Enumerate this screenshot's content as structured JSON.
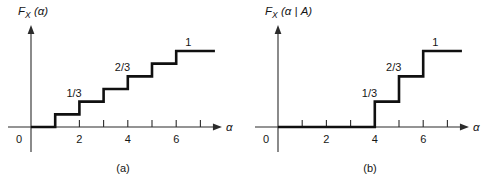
{
  "figure": {
    "background_color": "#ffffff",
    "line_color": "#101010",
    "axis_color": "#2b2b2b"
  },
  "chart_data": [
    {
      "type": "line",
      "panel_id": "a",
      "caption": "(a)",
      "title": "F_X(α)",
      "title_parts": {
        "F": "F",
        "sub": "X",
        "arg": "(α)"
      },
      "xlabel": "α",
      "ylabel": "",
      "xlim": [
        -1,
        8
      ],
      "ylim": [
        0,
        1.18
      ],
      "grid": false,
      "legend": "none",
      "x_ticks": [
        1,
        2,
        3,
        4,
        5,
        6,
        7
      ],
      "x_tick_labels": [
        "",
        "2",
        "",
        "4",
        "",
        "6",
        ""
      ],
      "origin_label": "0",
      "step_x": [
        1,
        2,
        3,
        4,
        5,
        6
      ],
      "step_y": [
        0.1667,
        0.3333,
        0.5,
        0.6667,
        0.8333,
        1.0
      ],
      "step_fractions": [
        "1/6",
        "2/6",
        "3/6",
        "4/6",
        "5/6",
        "1"
      ],
      "x_start": 0,
      "x_end": 7.6,
      "annotations": [
        {
          "text": "1/3",
          "x": 1.78,
          "y": 0.3333,
          "level": 0.3333
        },
        {
          "text": "2/3",
          "x": 3.78,
          "y": 0.6667,
          "level": 0.6667
        },
        {
          "text": "1",
          "x": 6.5,
          "y": 1.0,
          "level": 1.0
        }
      ]
    },
    {
      "type": "line",
      "panel_id": "b",
      "caption": "(b)",
      "title": "F_X(α | A)",
      "title_parts": {
        "F": "F",
        "sub": "X",
        "arg": "(α | A)"
      },
      "xlabel": "α",
      "ylabel": "",
      "xlim": [
        -1,
        8
      ],
      "ylim": [
        0,
        1.18
      ],
      "grid": false,
      "legend": "none",
      "x_ticks": [
        1,
        2,
        3,
        4,
        5,
        6,
        7
      ],
      "x_tick_labels": [
        "",
        "2",
        "",
        "4",
        "",
        "6",
        ""
      ],
      "origin_label": "0",
      "step_x": [
        4,
        5,
        6
      ],
      "step_y": [
        0.3333,
        0.6667,
        1.0
      ],
      "step_fractions": [
        "1/3",
        "2/3",
        "1"
      ],
      "x_start": 0,
      "x_end": 7.6,
      "annotations": [
        {
          "text": "1/3",
          "x": 3.78,
          "y": 0.3333,
          "level": 0.3333
        },
        {
          "text": "2/3",
          "x": 4.78,
          "y": 0.6667,
          "level": 0.6667
        },
        {
          "text": "1",
          "x": 6.5,
          "y": 1.0,
          "level": 1.0
        }
      ]
    }
  ]
}
